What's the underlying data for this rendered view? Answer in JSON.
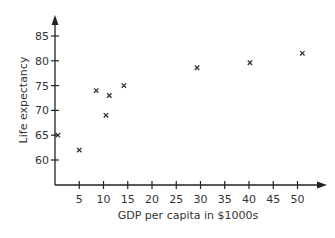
{
  "chart_data": {
    "type": "scatter",
    "title": "",
    "xlabel": "GDP per capita in $1000s",
    "ylabel": "Life expectancy",
    "xlim": [
      0,
      53
    ],
    "ylim": [
      55,
      88
    ],
    "x_ticks": [
      5,
      10,
      15,
      20,
      25,
      30,
      35,
      40,
      45,
      50
    ],
    "y_ticks": [
      60,
      65,
      70,
      75,
      80,
      85
    ],
    "grid": false,
    "legend": null,
    "marker": "x",
    "points": [
      {
        "x": 0.6,
        "y": 65
      },
      {
        "x": 5,
        "y": 62
      },
      {
        "x": 8.5,
        "y": 74
      },
      {
        "x": 10.5,
        "y": 69
      },
      {
        "x": 11.2,
        "y": 73
      },
      {
        "x": 14.2,
        "y": 75
      },
      {
        "x": 29.3,
        "y": 78.6
      },
      {
        "x": 40.2,
        "y": 79.6
      },
      {
        "x": 51,
        "y": 81.5
      }
    ]
  }
}
